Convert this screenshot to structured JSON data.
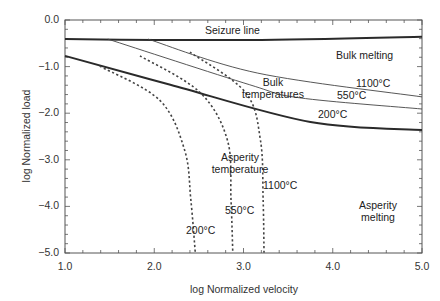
{
  "chart_data": {
    "type": "line",
    "title": "",
    "xlabel": "log Normalized velocity",
    "ylabel": "log Normalized load",
    "xlim": [
      1.0,
      5.0
    ],
    "ylim": [
      -5.0,
      0.0
    ],
    "x_ticks": [
      "1.0",
      "2.0",
      "3.0",
      "4.0",
      "5.0"
    ],
    "y_ticks": [
      "0.0",
      "-1.0",
      "-2.0",
      "-3.0",
      "-4.0",
      "-5.0"
    ],
    "grid": false,
    "legend": null,
    "series": [
      {
        "name": "Seizure line",
        "style": "solid-thick",
        "x": [
          1.0,
          3.07,
          5.0
        ],
        "y": [
          -0.41,
          -0.43,
          -0.36
        ]
      },
      {
        "name": "Bulk temperature 1100°C",
        "style": "solid-thin",
        "x": [
          1.93,
          3.16,
          5.0
        ],
        "y": [
          -0.41,
          -1.14,
          -1.65
        ]
      },
      {
        "name": "Bulk temperature 550°C",
        "style": "solid-thin",
        "x": [
          1.48,
          3.07,
          3.63,
          5.0
        ],
        "y": [
          -0.41,
          -1.39,
          -1.67,
          -1.91
        ]
      },
      {
        "name": "Bulk temperature 200°C",
        "style": "solid-thick",
        "x": [
          1.0,
          2.18,
          3.75,
          5.0
        ],
        "y": [
          -0.77,
          -1.39,
          -2.19,
          -2.36
        ]
      },
      {
        "name": "Asperity temperature 200°C",
        "style": "dashed",
        "x": [
          1.39,
          2.06,
          2.34,
          2.41,
          2.46
        ],
        "y": [
          -0.99,
          -1.72,
          -2.79,
          -3.86,
          -5.0
        ]
      },
      {
        "name": "Asperity temperature 550°C",
        "style": "dashed",
        "x": [
          1.84,
          2.51,
          2.82,
          2.86,
          2.88
        ],
        "y": [
          -0.77,
          -1.55,
          -2.58,
          -3.86,
          -5.0
        ]
      },
      {
        "name": "Asperity temperature 1100°C",
        "style": "dashed",
        "x": [
          2.4,
          3.02,
          3.19,
          3.22,
          3.23
        ],
        "y": [
          -0.69,
          -1.55,
          -2.58,
          -3.86,
          -5.0
        ]
      }
    ],
    "annotations": [
      {
        "text": "Seizure line",
        "x": 3.1,
        "y": -0.25
      },
      {
        "text": "Bulk melting",
        "x": 4.4,
        "y": -0.9
      },
      {
        "text": "Bulk temperatures",
        "x": 3.1,
        "y": -1.3
      },
      {
        "text": "1100°C",
        "x": 4.4,
        "y": -1.4
      },
      {
        "text": "550°C",
        "x": 3.95,
        "y": -1.6
      },
      {
        "text": "200°C",
        "x": 3.5,
        "y": -1.95
      },
      {
        "text": "Asperity temperature",
        "x": 2.9,
        "y": -2.8
      },
      {
        "text": "1100°C",
        "x": 3.3,
        "y": -3.5
      },
      {
        "text": "550°C",
        "x": 2.85,
        "y": -4.05
      },
      {
        "text": "200°C",
        "x": 2.4,
        "y": -4.5
      },
      {
        "text": "Asperity melting",
        "x": 4.3,
        "y": -4.2
      }
    ]
  },
  "labels": {
    "seizure": "Seizure line",
    "bulk_melting": "Bulk melting",
    "bulk_temps_1": "Bulk",
    "bulk_temps_2": "temperatures",
    "bulk_1100": "1100°C",
    "bulk_550": "550°C",
    "bulk_200": "200°C",
    "asp_temp_1": "Asperity",
    "asp_temp_2": "temperature",
    "asp_1100": "1100°C",
    "asp_550": "550°C",
    "asp_200": "200°C",
    "asp_melting_1": "Asperity",
    "asp_melting_2": "melting"
  }
}
